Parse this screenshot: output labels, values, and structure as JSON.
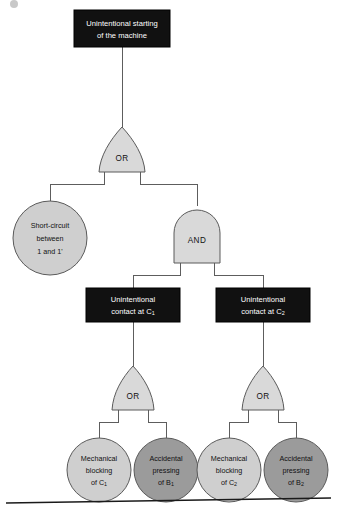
{
  "diagram": {
    "type": "fault-tree",
    "title_node": {
      "id": "top-event",
      "label_line1": "Unintentional starting",
      "label_line2": "of the machine",
      "shape": "rectangle",
      "fill": "#111111",
      "text_color": "#ffffff"
    },
    "gates": [
      {
        "id": "gate-or-top",
        "label": "OR",
        "shape": "or",
        "fill": "#d9d9d9"
      },
      {
        "id": "gate-and",
        "label": "AND",
        "shape": "and",
        "fill": "#d9d9d9"
      },
      {
        "id": "gate-or-left",
        "label": "OR",
        "shape": "or",
        "fill": "#d9d9d9"
      },
      {
        "id": "gate-or-right",
        "label": "OR",
        "shape": "or",
        "fill": "#d9d9d9"
      }
    ],
    "intermediate_events": [
      {
        "id": "event-contact-c1",
        "label_line1": "Unintentional",
        "label_line2_pre": "contact at C",
        "label_line2_sub": "1",
        "shape": "rectangle",
        "fill": "#111111"
      },
      {
        "id": "event-contact-c2",
        "label_line1": "Unintentional",
        "label_line2_pre": "contact at C",
        "label_line2_sub": "2",
        "shape": "rectangle",
        "fill": "#111111"
      }
    ],
    "basic_events": [
      {
        "id": "basic-short-circuit",
        "line1": "Short-circuit",
        "line2": "between",
        "line3": "1 and 1'",
        "shape": "circle",
        "fill": "#cfcfcf"
      },
      {
        "id": "basic-mech-block-c1",
        "line1": "Mechanical",
        "line2": "blocking",
        "line3_pre": "of C",
        "line3_sub": "1",
        "shape": "circle",
        "fill": "#cfcfcf"
      },
      {
        "id": "basic-acc-press-b1",
        "line1": "Accidental",
        "line2": "pressing",
        "line3_pre": "of B",
        "line3_sub": "1",
        "shape": "circle",
        "fill": "#9b9b9b"
      },
      {
        "id": "basic-mech-block-c2",
        "line1": "Mechanical",
        "line2": "blocking",
        "line3_pre": "of C",
        "line3_sub": "2",
        "shape": "circle",
        "fill": "#cfcfcf"
      },
      {
        "id": "basic-acc-press-b2",
        "line1": "Accidental",
        "line2": "pressing",
        "line3_pre": "of B",
        "line3_sub": "2",
        "shape": "circle",
        "fill": "#9b9b9b"
      }
    ],
    "colors": {
      "edge": "#5d5d5d",
      "box_fill": "#111111",
      "gate_fill": "#d9d9d9",
      "circle_light": "#cfcfcf",
      "circle_dark": "#9b9b9b",
      "rule": "#1a1a1a",
      "background": "#ffffff"
    }
  }
}
